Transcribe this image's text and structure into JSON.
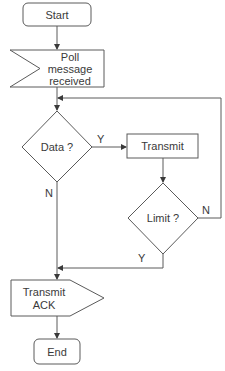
{
  "diagram": {
    "type": "flowchart",
    "nodes": {
      "start": {
        "label": "Start",
        "shape": "terminator"
      },
      "poll": {
        "label_lines": [
          "Poll",
          "message",
          "received"
        ],
        "shape": "receive-signal"
      },
      "data": {
        "label": "Data ?",
        "shape": "decision"
      },
      "transmit": {
        "label": "Transmit",
        "shape": "process"
      },
      "limit": {
        "label": "Limit ?",
        "shape": "decision"
      },
      "ack": {
        "label_lines": [
          "Transmit",
          "ACK"
        ],
        "shape": "send-signal"
      },
      "end": {
        "label": "End",
        "shape": "terminator"
      }
    },
    "edges": {
      "data_yes": "Y",
      "data_no": "N",
      "limit_no": "N",
      "limit_yes": "Y"
    }
  }
}
